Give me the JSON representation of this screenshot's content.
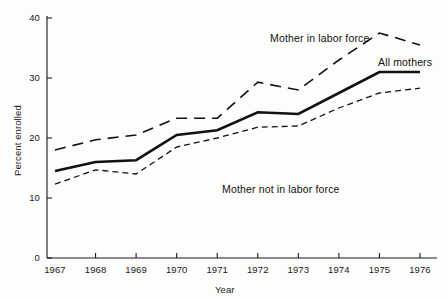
{
  "chart_data": {
    "type": "line",
    "title": "",
    "subtitle": "",
    "xlabel": "Year",
    "ylabel": "Percent enrolled",
    "x": [
      1967,
      1968,
      1969,
      1970,
      1971,
      1972,
      1973,
      1974,
      1975,
      1976
    ],
    "xtick_labels": [
      "1967",
      "1968",
      "1969",
      "1970",
      "1971",
      "1972",
      "1973",
      "1974",
      "1975",
      "1976"
    ],
    "ytick_labels": [
      "0",
      "10",
      "20",
      "30",
      "40"
    ],
    "yticks": [
      0,
      10,
      20,
      30,
      40
    ],
    "xlim": [
      1967,
      1976
    ],
    "ylim": [
      0,
      40
    ],
    "grid": false,
    "legend_position": "inline-annotations",
    "series": [
      {
        "name": "Mother in labor force",
        "style": "long-dashed",
        "color": "#111111",
        "width": 1.6,
        "values": [
          18.0,
          19.7,
          20.5,
          23.3,
          23.3,
          29.3,
          28.0,
          33.0,
          37.5,
          35.5
        ]
      },
      {
        "name": "All mothers",
        "style": "solid",
        "color": "#111111",
        "width": 2.6,
        "values": [
          14.5,
          16.0,
          16.3,
          20.5,
          21.3,
          24.3,
          24.0,
          27.5,
          31.0,
          31.0
        ]
      },
      {
        "name": "Mother not in labor force",
        "style": "short-dashed",
        "color": "#111111",
        "width": 1.3,
        "values": [
          12.3,
          14.7,
          14.0,
          18.5,
          20.0,
          21.8,
          22.0,
          25.0,
          27.5,
          28.3
        ]
      }
    ],
    "annotations": [
      {
        "text": "Mother in labor force",
        "x_px": 270,
        "y_px": 32
      },
      {
        "text": "All mothers",
        "x_px": 378,
        "y_px": 56
      },
      {
        "text": "Mother not in labor force",
        "x_px": 222,
        "y_px": 183
      }
    ]
  },
  "axes": {
    "y_title": "Percent enrolled",
    "x_title": "Year",
    "y_ticks": [
      {
        "label": "40",
        "value": 40
      },
      {
        "label": "30",
        "value": 30
      },
      {
        "label": "20",
        "value": 20
      },
      {
        "label": "10",
        "value": 10
      },
      {
        "label": "0",
        "value": 0
      }
    ],
    "x_ticks": [
      {
        "label": "1967",
        "value": 1967
      },
      {
        "label": "1968",
        "value": 1968
      },
      {
        "label": "1969",
        "value": 1969
      },
      {
        "label": "1970",
        "value": 1970
      },
      {
        "label": "1971",
        "value": 1971
      },
      {
        "label": "1972",
        "value": 1972
      },
      {
        "label": "1973",
        "value": 1973
      },
      {
        "label": "1974",
        "value": 1974
      },
      {
        "label": "1975",
        "value": 1975
      },
      {
        "label": "1976",
        "value": 1976
      }
    ]
  },
  "style": {
    "background": "#fdfdfc",
    "ink": "#111111",
    "axis_color": "#1a1a1a"
  }
}
